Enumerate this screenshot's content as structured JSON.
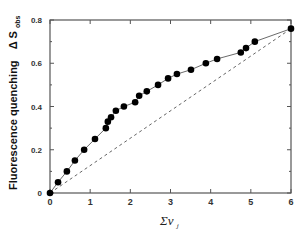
{
  "chart_data": {
    "type": "scatter",
    "title": "",
    "xlabel": "Σν_j",
    "ylabel": "Fluorescence quenching ΔS_obs",
    "xlim": [
      0,
      6
    ],
    "ylim": [
      0,
      0.8
    ],
    "xticks": [
      "0",
      "1",
      "2",
      "3",
      "4",
      "5",
      "6"
    ],
    "yticks": [
      "0",
      "0.2",
      "0.4",
      "0.6",
      "0.8"
    ],
    "grid": false,
    "legend": null,
    "series": [
      {
        "name": "observed",
        "style": "filled-circle-markers with solid fitted curve",
        "x": [
          0,
          0.2,
          0.42,
          0.62,
          0.85,
          1.12,
          1.39,
          1.44,
          1.52,
          1.64,
          1.84,
          2.12,
          2.22,
          2.41,
          2.69,
          2.94,
          3.16,
          3.51,
          3.88,
          4.16,
          4.75,
          4.88,
          5.1,
          6.0
        ],
        "y": [
          0,
          0.05,
          0.1,
          0.15,
          0.2,
          0.25,
          0.3,
          0.33,
          0.35,
          0.38,
          0.4,
          0.42,
          0.45,
          0.47,
          0.5,
          0.53,
          0.55,
          0.57,
          0.6,
          0.62,
          0.65,
          0.67,
          0.7,
          0.76
        ]
      },
      {
        "name": "linear reference",
        "style": "dashed line",
        "x": [
          0,
          6
        ],
        "y": [
          0,
          0.76
        ]
      }
    ]
  },
  "labels": {
    "ylabel_main": "Fluorescence quenching",
    "ylabel_delta": "Δ S",
    "ylabel_sub": "obs",
    "xlabel_main": "Σν",
    "xlabel_sub": "j"
  }
}
